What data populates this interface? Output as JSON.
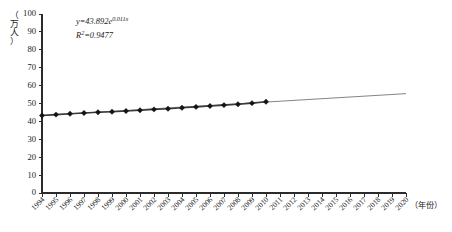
{
  "chart_data": {
    "type": "line",
    "title": "",
    "xlabel": "（年份）",
    "ylabel": "（万人）",
    "ylim": [
      0,
      100
    ],
    "ytick_values": [
      0,
      10,
      20,
      30,
      40,
      50,
      60,
      70,
      80,
      90,
      100
    ],
    "grid": false,
    "legend": null,
    "categories": [
      "1994",
      "1995",
      "1996",
      "1997",
      "1998",
      "1999",
      "2000",
      "2001",
      "2002",
      "2003",
      "2004",
      "2005",
      "2006",
      "2007",
      "2008",
      "2009",
      "2010",
      "2011",
      "2012",
      "2013",
      "2014",
      "2015",
      "2016",
      "2017",
      "2018",
      "2019",
      "2020"
    ],
    "series": [
      {
        "name": "observed",
        "marker": "diamond",
        "values": [
          43.3,
          43.8,
          44.3,
          44.7,
          45.1,
          45.4,
          45.8,
          46.2,
          46.7,
          47.1,
          47.6,
          48.1,
          48.6,
          49.1,
          49.6,
          50.2,
          51.0,
          null,
          null,
          null,
          null,
          null,
          null,
          null,
          null,
          null,
          null
        ]
      },
      {
        "name": "fitted-trend",
        "marker": "none",
        "values": [
          43.3,
          null,
          null,
          null,
          null,
          null,
          null,
          null,
          null,
          null,
          null,
          null,
          null,
          null,
          null,
          null,
          51.0,
          null,
          null,
          null,
          null,
          null,
          null,
          null,
          null,
          null,
          55.5
        ]
      }
    ],
    "annotations": [
      {
        "id": "equation",
        "text": "y=43.892e0.011x"
      },
      {
        "id": "r-squared",
        "text": "R2=0.9477"
      }
    ]
  },
  "annotation_parts": {
    "equation_lead": "y=43.892e",
    "equation_exponent": "0.011x",
    "rsq_lead": "R",
    "rsq_sup": "2",
    "rsq_tail": "=0.9477"
  },
  "axis_titles": {
    "y_chars": [
      "（",
      "万",
      "人",
      "）"
    ],
    "x_label": "（年份）"
  }
}
